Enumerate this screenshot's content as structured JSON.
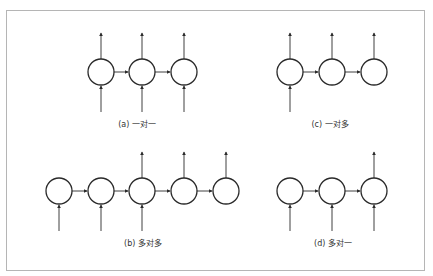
{
  "figure": {
    "frame_color": "#b5b5b5",
    "stroke_color": "#2a2a2a",
    "panels": [
      {
        "id": "a",
        "caption": "(a) 一对一",
        "caption_x": 137,
        "caption_y": 127,
        "cy": 72,
        "nodes_x": [
          101,
          142,
          184
        ],
        "inputs": [
          0,
          1,
          2
        ],
        "outputs": [
          0,
          1,
          2
        ]
      },
      {
        "id": "c",
        "caption": "(c) 一对多",
        "caption_x": 330,
        "caption_y": 127,
        "cy": 72,
        "nodes_x": [
          290,
          332,
          374
        ],
        "inputs": [
          0
        ],
        "outputs": [
          0,
          1,
          2
        ]
      },
      {
        "id": "b",
        "caption": "(b) 多对多",
        "caption_x": 143,
        "caption_y": 246,
        "cy": 191,
        "nodes_x": [
          59,
          101,
          142,
          184,
          226
        ],
        "inputs": [
          0,
          1,
          2
        ],
        "outputs": [
          2,
          3,
          4
        ]
      },
      {
        "id": "d",
        "caption": "(d) 多对一",
        "caption_x": 333,
        "caption_y": 246,
        "cy": 191,
        "nodes_x": [
          290,
          332,
          374
        ],
        "inputs": [
          0,
          1,
          2
        ],
        "outputs": [
          2
        ]
      }
    ],
    "node_radius": 13,
    "arrow_len_up": 26,
    "arrow_len_down": 27
  }
}
